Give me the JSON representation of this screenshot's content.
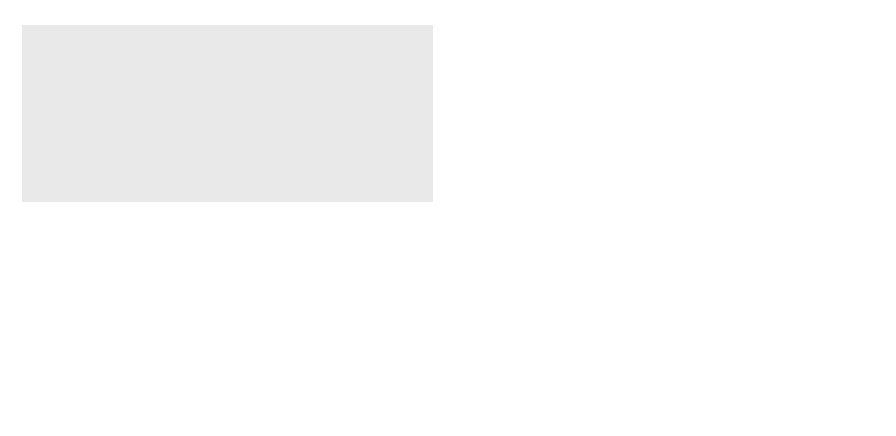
{
  "figure": {
    "panels": [
      {
        "id": "a",
        "caption": "(a)",
        "y_axis_label": "f(x)",
        "x_axis_label": "x",
        "description": "Two-point Gauss-style comparison: function curve and quadratic (parabola) through three points; hatched area under the dashed parabola between a and b"
      },
      {
        "id": "b",
        "caption": "(b)",
        "y_axis_label": "f(x)",
        "x_axis_label": "x",
        "description": "Function curve and cubic through four points; hatched area under the dashed cubic between a and b"
      }
    ],
    "colors": {
      "background": "#e9e9e9",
      "curve": "#6e6e6e",
      "point": "#6e6e6e",
      "axis": "#1a1a1a",
      "hatch": "#1a1a1a"
    }
  }
}
